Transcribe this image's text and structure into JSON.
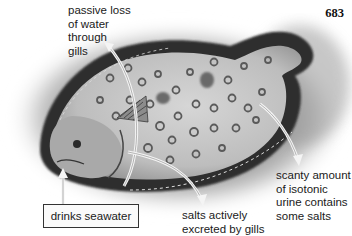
{
  "page": {
    "number": "683"
  },
  "figure": {
    "style": "grayscale illustration",
    "colors": {
      "background": "#ffffff",
      "sand_shadow": "#8a8a8a",
      "body": "#c9c9c9",
      "fin_fringe": "#2e2e2e",
      "spots": "#5a5a5a",
      "arrow": "#f2f2f2"
    }
  },
  "labels": {
    "gill_water_loss": [
      "passive loss",
      "of water",
      "through",
      "gills"
    ],
    "urine": [
      "scanty amount",
      "of isotonic",
      "urine contains",
      "some salts"
    ],
    "salt_excretion": [
      "salts actively",
      "excreted by gills"
    ],
    "drinks": "drinks seawater"
  }
}
